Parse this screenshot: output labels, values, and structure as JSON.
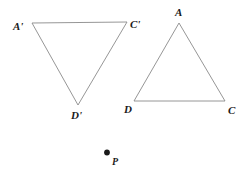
{
  "figure": {
    "background_color": "#ffffff",
    "stroke_color": "#8a8a8a",
    "label_color": "#1a1a1a",
    "point_color": "#1a1a1a",
    "shapes": [
      {
        "name": "triangle-image",
        "vertices": [
          {
            "label": "A'",
            "x": 32,
            "y": 23
          },
          {
            "label": "C'",
            "x": 127,
            "y": 22
          },
          {
            "label": "D'",
            "x": 78,
            "y": 105
          }
        ]
      },
      {
        "name": "triangle-preimage",
        "vertices": [
          {
            "label": "A",
            "x": 179,
            "y": 23
          },
          {
            "label": "D",
            "x": 134,
            "y": 101
          },
          {
            "label": "C",
            "x": 225,
            "y": 101
          }
        ]
      }
    ],
    "labels": {
      "a_prime": "A'",
      "c_prime": "C'",
      "d_prime": "D'",
      "a": "A",
      "d": "D",
      "c": "C",
      "p": "P"
    },
    "center_of_rotation": {
      "label": "P",
      "x": 107,
      "y": 153
    }
  }
}
